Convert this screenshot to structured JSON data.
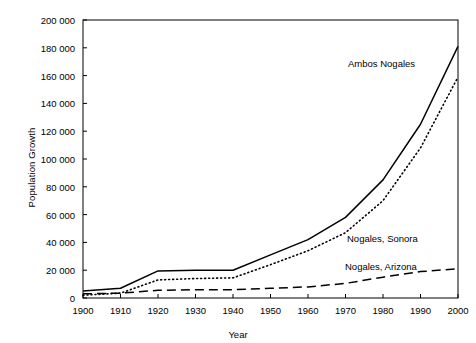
{
  "chart_data": {
    "type": "line",
    "title": "",
    "xlabel": "Year",
    "ylabel": "Population Growth",
    "xlim": [
      1900,
      2000
    ],
    "ylim": [
      0,
      200000
    ],
    "grid": false,
    "legend_position": "inline-annotations",
    "x": [
      1900,
      1910,
      1920,
      1930,
      1940,
      1950,
      1960,
      1970,
      1980,
      1990,
      2000
    ],
    "xticklabels": [
      "1900",
      "1910",
      "1920",
      "1930",
      "1940",
      "1950",
      "1960",
      "1970",
      "1980",
      "1990",
      "2000"
    ],
    "yticks": [
      0,
      20000,
      40000,
      60000,
      80000,
      100000,
      120000,
      140000,
      160000,
      180000,
      200000
    ],
    "yticklabels": [
      "0",
      "20 000",
      "40 000",
      "60 000",
      "80 000",
      "100 000",
      "120 000",
      "140 000",
      "160 000",
      "180 000",
      "200 000"
    ],
    "series": [
      {
        "name": "Ambos Nogales",
        "style": "solid",
        "color": "#000000",
        "values": [
          5000,
          7000,
          19500,
          20000,
          20000,
          31000,
          42000,
          58000,
          85000,
          125000,
          181000
        ]
      },
      {
        "name": "Nogales, Sonora",
        "style": "dotted",
        "color": "#000000",
        "values": [
          2000,
          3500,
          13000,
          14000,
          14500,
          24000,
          34000,
          47000,
          70000,
          108000,
          159000
        ]
      },
      {
        "name": "Nogales, Arizona",
        "style": "dashed",
        "color": "#000000",
        "values": [
          3000,
          3500,
          5500,
          6000,
          6000,
          7000,
          8000,
          10500,
          15000,
          19000,
          21000
        ]
      }
    ],
    "annotations": [
      {
        "text": "Ambos Nogales",
        "x_px": 348,
        "y_px": 58
      },
      {
        "text": "Nogales, Sonora",
        "x_px": 347,
        "y_px": 233
      },
      {
        "text": "Nogales, Arizona",
        "x_px": 345,
        "y_px": 261
      }
    ]
  },
  "axes": {
    "plot_left_px": 83,
    "plot_right_px": 458,
    "plot_top_px": 20,
    "plot_bottom_px": 298
  }
}
